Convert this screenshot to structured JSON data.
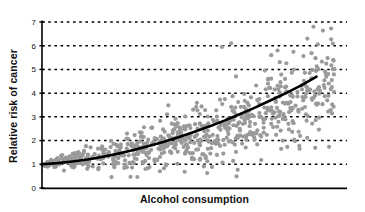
{
  "chart_data": {
    "type": "scatter",
    "title": "",
    "xlabel": "Alcohol consumption",
    "ylabel": "Relative risk of cancer",
    "xlim": [
      0,
      10
    ],
    "ylim": [
      0,
      7
    ],
    "yticks": [
      0,
      1,
      2,
      3,
      4,
      5,
      6,
      7
    ],
    "ytick_labels": [
      "0",
      "1",
      "2",
      "3",
      "4",
      "5",
      "6",
      "7"
    ],
    "xticks": [],
    "xtick_labels": [],
    "grid": "horizontal-dotted",
    "legend": "none",
    "series": [
      {
        "name": "observations",
        "type": "scatter",
        "marker_color": "#9a9a9a",
        "marker_size": 2.1,
        "n_points": 700,
        "description": "Gray points, relative risk rising with alcohol consumption; spread (variance) increases with x.",
        "model": {
          "mean": "1.0 * exp(0.155 * x)",
          "noise_sd": "0.055 + 0.105 * x",
          "x_range": [
            0,
            10
          ]
        }
      },
      {
        "name": "fitted trend",
        "type": "line",
        "line_color": "#000000",
        "line_width": 2.6,
        "description": "Thick black exponential fit curve.",
        "points": [
          {
            "x": 0.0,
            "y": 1.0
          },
          {
            "x": 0.5,
            "y": 1.05
          },
          {
            "x": 1.0,
            "y": 1.12
          },
          {
            "x": 1.5,
            "y": 1.2
          },
          {
            "x": 2.0,
            "y": 1.32
          },
          {
            "x": 2.5,
            "y": 1.45
          },
          {
            "x": 3.0,
            "y": 1.6
          },
          {
            "x": 3.5,
            "y": 1.77
          },
          {
            "x": 4.0,
            "y": 1.95
          },
          {
            "x": 4.5,
            "y": 2.15
          },
          {
            "x": 5.0,
            "y": 2.37
          },
          {
            "x": 5.5,
            "y": 2.6
          },
          {
            "x": 6.0,
            "y": 2.85
          },
          {
            "x": 6.5,
            "y": 3.12
          },
          {
            "x": 7.0,
            "y": 3.4
          },
          {
            "x": 7.5,
            "y": 3.7
          },
          {
            "x": 8.0,
            "y": 4.0
          },
          {
            "x": 8.5,
            "y": 4.33
          },
          {
            "x": 9.0,
            "y": 4.7
          }
        ]
      }
    ],
    "annotations": [
      {
        "label": "high outlier",
        "x": 8.9,
        "y": 6.8
      },
      {
        "label": "high outlier",
        "x": 8.7,
        "y": 6.3
      },
      {
        "label": "high outlier",
        "x": 6.2,
        "y": 6.1
      },
      {
        "label": "high outlier",
        "x": 5.9,
        "y": 5.95
      }
    ],
    "colors": {
      "points": "#9a9a9a",
      "trend_line": "#000000",
      "axis": "#000000",
      "gridline": "#000000",
      "background": "#ffffff"
    }
  },
  "axes": {
    "y_title": "Relative risk of cancer",
    "x_title": "Alcohol consumption",
    "y_tick_labels": [
      "0",
      "1",
      "2",
      "3",
      "4",
      "5",
      "6",
      "7"
    ]
  }
}
